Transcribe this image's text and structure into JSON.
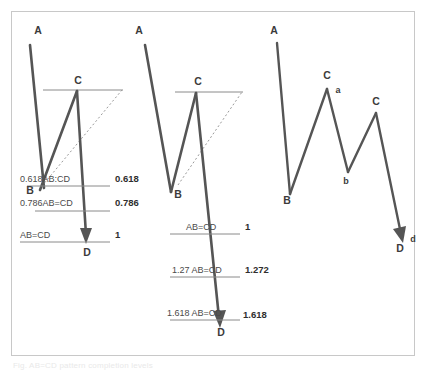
{
  "figure": {
    "frame_color": "#c8c8c8",
    "line_color": "#555555",
    "level_line_color": "#8a8a8a",
    "dotted_line_color": "#9a9a9a",
    "background": "#ffffff",
    "caption": "Fig. AB=CD pattern completion levels"
  },
  "panels": [
    {
      "id": "panel-left",
      "name": "bullish-abcd-retracement-panel",
      "points": [
        {
          "label": "A",
          "x": 38,
          "y": 30
        },
        {
          "label": "B",
          "x": 30,
          "y": 190
        },
        {
          "label": "C",
          "x": 78,
          "y": 80
        },
        {
          "label": "D",
          "x": 87,
          "y": 249
        }
      ],
      "levels": [
        {
          "text": "0.618AB:CD",
          "value": "0.618",
          "y": 179
        },
        {
          "text": "0.786AB=CD",
          "value": "0.786",
          "y": 203
        },
        {
          "text": "AB=CD",
          "value": "1",
          "y": 235
        }
      ]
    },
    {
      "id": "panel-middle",
      "name": "abcd-extension-panel",
      "points": [
        {
          "label": "A",
          "x": 139,
          "y": 30
        },
        {
          "label": "B",
          "x": 178,
          "y": 194
        },
        {
          "label": "C",
          "x": 198,
          "y": 80
        },
        {
          "label": "D",
          "x": 221,
          "y": 330
        }
      ],
      "levels": [
        {
          "text": "AB=CD",
          "value": "1",
          "y": 228
        },
        {
          "text": "1.27 AB=CD",
          "value": "1.272",
          "y": 270
        },
        {
          "text": "1.618 AB=CD",
          "value": "1.618",
          "y": 313
        }
      ]
    },
    {
      "id": "panel-right",
      "name": "abcd-wave-structure-panel",
      "points": [
        {
          "label": "A",
          "x": 274,
          "y": 30
        },
        {
          "label": "B",
          "x": 287,
          "y": 199
        },
        {
          "label": "C",
          "x": 327,
          "y": 75
        },
        {
          "label": "a",
          "x": 338,
          "y": 89
        },
        {
          "label": "b",
          "x": 346,
          "y": 178
        },
        {
          "label": "C",
          "x": 376,
          "y": 101
        },
        {
          "label": "D",
          "x": 400,
          "y": 243
        },
        {
          "label": "d",
          "x": 412,
          "y": 233
        }
      ]
    }
  ]
}
